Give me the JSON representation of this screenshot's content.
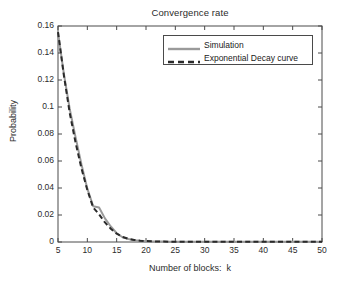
{
  "chart_data": {
    "type": "line",
    "title": "Convergence rate",
    "xlabel": "Number of blocks:  k",
    "ylabel": "Probability",
    "xlim": [
      5,
      50
    ],
    "ylim": [
      0,
      0.16
    ],
    "xticks": [
      5,
      10,
      15,
      20,
      25,
      30,
      35,
      40,
      45,
      50
    ],
    "yticks": [
      0,
      0.02,
      0.04,
      0.06,
      0.08,
      0.1,
      0.12,
      0.14,
      0.16
    ],
    "ytick_labels": [
      "0",
      "0.02",
      "0.04",
      "0.06",
      "0.08",
      "0.1",
      "0.12",
      "0.14",
      "0.16"
    ],
    "xtick_labels": [
      "5",
      "10",
      "15",
      "20",
      "25",
      "30",
      "35",
      "40",
      "45",
      "50"
    ],
    "grid": false,
    "legend_position": "top-right",
    "x": [
      5,
      6,
      7,
      8,
      9,
      10,
      11,
      12,
      13,
      14,
      15,
      16,
      17,
      18,
      19,
      20,
      21,
      22,
      23,
      24,
      25,
      26,
      27,
      28,
      29,
      30,
      31,
      32,
      33,
      34,
      35,
      36,
      37,
      38,
      39,
      40,
      41,
      42,
      43,
      44,
      45,
      46,
      47,
      48,
      49,
      50
    ],
    "series": [
      {
        "name": "Simulation",
        "style": "solid",
        "color": "#9a9a9a",
        "linewidth": 2,
        "values": [
          0.1555,
          0.1245,
          0.0985,
          0.0775,
          0.0575,
          0.0395,
          0.0265,
          0.0255,
          0.0175,
          0.0115,
          0.0065,
          0.0035,
          0.0022,
          0.0013,
          0.0009,
          0.0006,
          0.0004,
          0.0003,
          0.0003,
          0.0002,
          0.0002,
          0.0002,
          0.0001,
          0.0001,
          0.0001,
          0.0001,
          0.0001,
          0.0001,
          0.0001,
          0.0001,
          0.0001,
          0.0001,
          0.0001,
          0.0001,
          0.0001,
          0.0001,
          0.0001,
          0.0001,
          0.0001,
          0.0001,
          0.0001,
          0.0001,
          0.0001,
          0.0001,
          0.0001,
          0.0001
        ]
      },
      {
        "name": "Exponential Decay curve",
        "style": "dashed",
        "color": "#2a2a2a",
        "linewidth": 2,
        "values": [
          0.1555,
          0.1235,
          0.0955,
          0.0735,
          0.0545,
          0.0385,
          0.0255,
          0.0205,
          0.0145,
          0.0098,
          0.0062,
          0.0038,
          0.0024,
          0.0015,
          0.001,
          0.0007,
          0.0005,
          0.0004,
          0.0003,
          0.0002,
          0.0002,
          0.0002,
          0.0001,
          0.0001,
          0.0001,
          0.0001,
          0.0001,
          0.0001,
          0.0001,
          0.0001,
          0.0001,
          0.0001,
          0.0001,
          0.0001,
          0.0001,
          0.0001,
          0.0001,
          0.0001,
          0.0001,
          0.0001,
          0.0001,
          0.0001,
          0.0001,
          0.0001,
          0.0001,
          0.0001
        ]
      }
    ],
    "legend": [
      "Simulation",
      "Exponential Decay curve"
    ],
    "axis_color": "#4a4a4a",
    "background": "#ffffff"
  }
}
